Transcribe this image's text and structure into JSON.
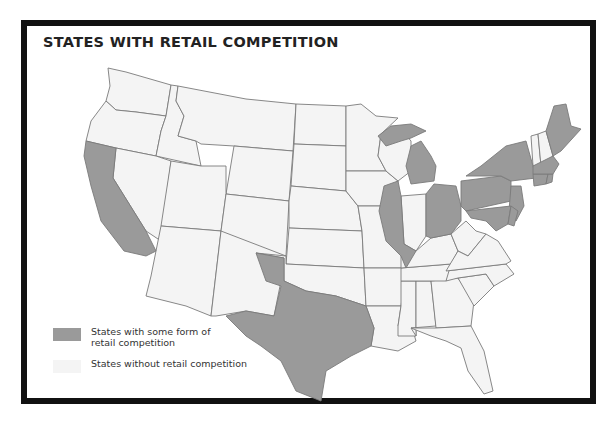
{
  "title": "STATES WITH RETAIL COMPETITION",
  "colors": {
    "competition": "#9a9a9a",
    "no_competition": "#f4f4f4",
    "border": "#7a7a7a",
    "frame": "#111111"
  },
  "legend": {
    "items": [
      {
        "label": "States with some form of retail competition",
        "key": "competition"
      },
      {
        "label": "States without retail competition",
        "key": "no_competition"
      }
    ]
  },
  "map": {
    "states_with_retail_competition": [
      "CA",
      "TX",
      "IL",
      "MI",
      "OH",
      "PA",
      "NY",
      "NJ",
      "MD",
      "DE",
      "DC",
      "CT",
      "RI",
      "MA",
      "ME"
    ],
    "states_without_retail_competition": [
      "WA",
      "OR",
      "ID",
      "MT",
      "WY",
      "NV",
      "UT",
      "CO",
      "AZ",
      "NM",
      "ND",
      "SD",
      "NE",
      "KS",
      "OK",
      "MN",
      "IA",
      "MO",
      "AR",
      "LA",
      "WI",
      "IN",
      "KY",
      "TN",
      "MS",
      "AL",
      "GA",
      "FL",
      "SC",
      "NC",
      "VA",
      "WV",
      "VT",
      "NH"
    ]
  }
}
